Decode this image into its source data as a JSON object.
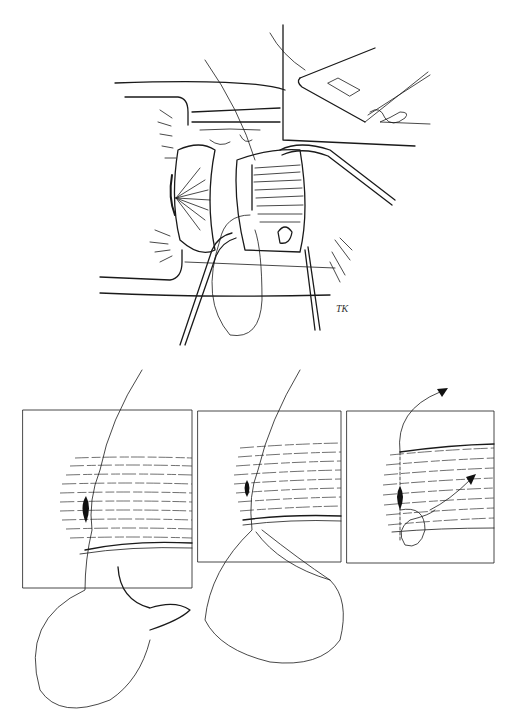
{
  "figure": {
    "panels": [
      {
        "id": "a",
        "label": "a",
        "description": "Surgical view of eye with retracted lids, muscle sutured with forceps and needle; inset showing suture on muscle edge"
      },
      {
        "id": "b",
        "label": "b",
        "description": "Muscle fibers with needle passing through, suture loop below"
      },
      {
        "id": "c",
        "label": "c",
        "description": "Muscle fibers with suture passed through, large loop below"
      },
      {
        "id": "d",
        "label": "d",
        "description": "Muscle fibers with locking suture loop and directional arrows"
      }
    ],
    "signature": "TK",
    "colors": {
      "line": "#1a1a1a",
      "background": "#ffffff"
    }
  }
}
